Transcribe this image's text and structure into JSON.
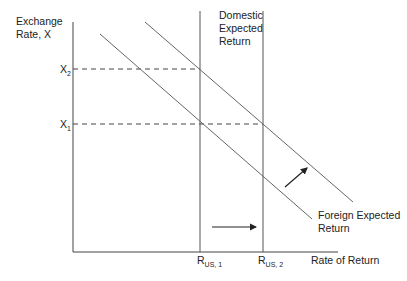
{
  "diagram": {
    "type": "exchange-rate-equilibrium",
    "y_axis_label_line1": "Exchange",
    "y_axis_label_line2": "Rate, X",
    "x_axis_label": "Rate of Return",
    "y_ticks": [
      {
        "base": "X",
        "sub": "2",
        "y": 69
      },
      {
        "base": "X",
        "sub": "1",
        "y": 124
      }
    ],
    "x_ticks": [
      {
        "base": "R",
        "sub": "US, 1",
        "x": 200
      },
      {
        "base": "R",
        "sub": "US, 2",
        "x": 263
      }
    ],
    "domestic_label": [
      "Domestic",
      "Expected",
      "Return"
    ],
    "foreign_label": [
      "Foreign Expected",
      "Return"
    ],
    "curves": [
      {
        "name": "foreign-expected-return-initial",
        "x1": 100,
        "y1": 34,
        "x2": 312,
        "y2": 219
      },
      {
        "name": "foreign-expected-return-shifted",
        "x1": 145,
        "y1": 22,
        "x2": 353,
        "y2": 202
      }
    ],
    "verticals": [
      {
        "name": "domestic-return-1",
        "x": 200,
        "y_top": 11
      },
      {
        "name": "domestic-return-2",
        "x": 263,
        "y_top": 11
      }
    ],
    "arrows": [
      {
        "name": "domestic-shift-arrow",
        "x1": 212,
        "y1": 227,
        "x2": 256,
        "y2": 227
      },
      {
        "name": "foreign-shift-arrow",
        "x1": 285,
        "y1": 187,
        "x2": 307,
        "y2": 168
      }
    ],
    "colors": {
      "line": "#555555",
      "axis": "#444444",
      "text": "#222222"
    }
  }
}
